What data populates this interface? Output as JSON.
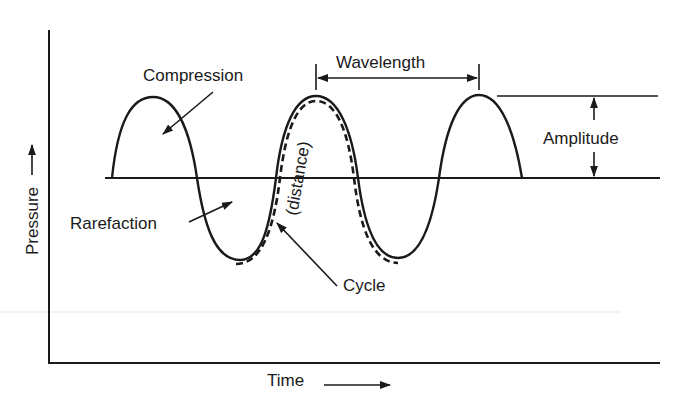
{
  "diagram": {
    "title": "",
    "axes": {
      "y_label": "Pressure",
      "x_label": "Time"
    },
    "labels": {
      "compression": "Compression",
      "rarefaction": "Rarefaction",
      "wavelength": "Wavelength",
      "amplitude": "Amplitude",
      "distance": "(distance)",
      "cycle": "Cycle"
    },
    "colors": {
      "ink": "#1a1a1a",
      "background": "#ffffff",
      "faint_rule": "#eeeeee"
    }
  }
}
